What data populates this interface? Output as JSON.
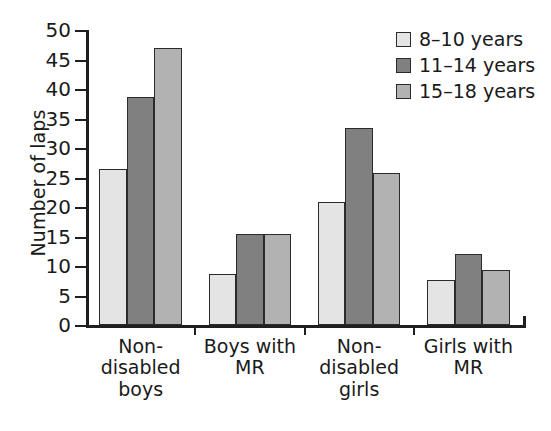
{
  "chart_data": {
    "type": "bar",
    "title": "",
    "subtitle": "",
    "xlabel": "",
    "ylabel": "Number of laps",
    "ylim": [
      0,
      50
    ],
    "ytick_step": 5,
    "yticks": [
      0,
      5,
      10,
      15,
      20,
      25,
      30,
      35,
      40,
      45,
      50
    ],
    "ytick_labels": [
      "0",
      "5",
      "10",
      "15",
      "20",
      "25",
      "30",
      "35",
      "40",
      "45",
      "50"
    ],
    "grid": false,
    "legend_position": "top-right",
    "legend_frame": false,
    "categories": [
      "Non-\ndisabled\nboys",
      "Boys with\nMR",
      "Non-\ndisabled\ngirls",
      "Girls with\nMR"
    ],
    "series": [
      {
        "name": "8–10 years",
        "color": "#e4e4e4",
        "values": [
          26.5,
          8.7,
          20.8,
          7.7
        ]
      },
      {
        "name": "11–14 years",
        "color": "#808080",
        "values": [
          38.7,
          15.5,
          33.4,
          12.1
        ]
      },
      {
        "name": "15–18 years",
        "color": "#b2b2b2",
        "values": [
          47.0,
          15.5,
          25.7,
          9.4
        ]
      }
    ],
    "annotations": []
  },
  "style": {
    "axis_color": "#1f1f1f",
    "bar_edge_color": "#2b2b2b",
    "background": "#ffffff",
    "text_color": "#1a1a1a"
  }
}
